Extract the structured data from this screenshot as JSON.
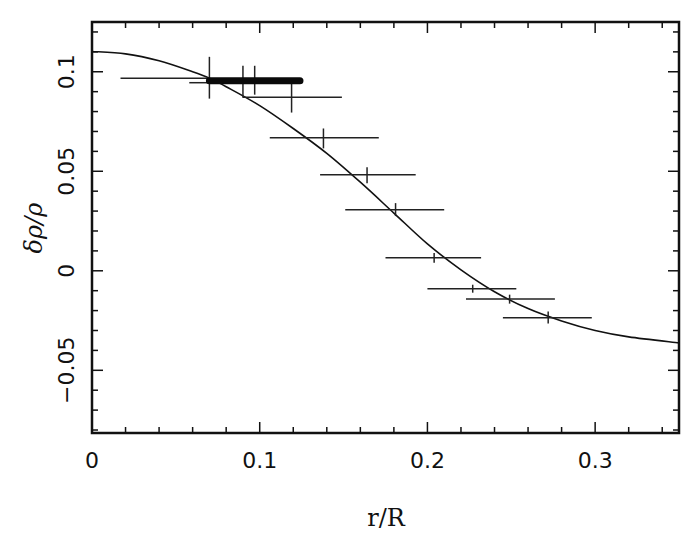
{
  "chart_data": {
    "type": "scatter",
    "title": "",
    "xlabel": "r/R",
    "ylabel": "δρ/ρ",
    "xlim": [
      0,
      0.35
    ],
    "ylim": [
      -0.0815,
      0.125
    ],
    "grid": false,
    "legend": null,
    "x_ticks": [
      {
        "value": 0,
        "label": "0"
      },
      {
        "value": 0.1,
        "label": "0.1"
      },
      {
        "value": 0.2,
        "label": "0.2"
      },
      {
        "value": 0.3,
        "label": "0.3"
      }
    ],
    "x_minor_step": 0.02,
    "y_ticks": [
      {
        "value": -0.05,
        "label": "−0.05"
      },
      {
        "value": 0,
        "label": "0"
      },
      {
        "value": 0.05,
        "label": "0.05"
      },
      {
        "value": 0.1,
        "label": "0.1"
      }
    ],
    "y_minor_step": 0.01,
    "series": [
      {
        "name": "measurements",
        "kind": "errorbar",
        "points": [
          {
            "x": 0.07,
            "y": 0.0968,
            "xmin": 0.017,
            "xmax": 0.07,
            "ymin": 0.0865,
            "ymax": 0.1075
          },
          {
            "x": 0.07,
            "y": 0.0945,
            "xmin": 0.058,
            "xmax": 0.07,
            "ymin": 0.0945,
            "ymax": 0.0945
          },
          {
            "x": 0.09,
            "y": 0.0955,
            "xmin": 0.09,
            "xmax": 0.09,
            "ymin": 0.087,
            "ymax": 0.103
          },
          {
            "x": 0.097,
            "y": 0.0955,
            "xmin": 0.097,
            "xmax": 0.097,
            "ymin": 0.0885,
            "ymax": 0.103
          },
          {
            "x": 0.119,
            "y": 0.0872,
            "xmin": 0.09,
            "xmax": 0.149,
            "ymin": 0.0795,
            "ymax": 0.0945
          },
          {
            "x": 0.138,
            "y": 0.0668,
            "xmin": 0.106,
            "xmax": 0.171,
            "ymin": 0.0615,
            "ymax": 0.0715
          },
          {
            "x": 0.164,
            "y": 0.0482,
            "xmin": 0.136,
            "xmax": 0.193,
            "ymin": 0.044,
            "ymax": 0.052
          },
          {
            "x": 0.181,
            "y": 0.0307,
            "xmin": 0.151,
            "xmax": 0.21,
            "ymin": 0.0275,
            "ymax": 0.034
          },
          {
            "x": 0.204,
            "y": 0.0065,
            "xmin": 0.175,
            "xmax": 0.232,
            "ymin": 0.004,
            "ymax": 0.009
          },
          {
            "x": 0.227,
            "y": -0.009,
            "xmin": 0.2,
            "xmax": 0.253,
            "ymin": -0.011,
            "ymax": -0.007
          },
          {
            "x": 0.249,
            "y": -0.0142,
            "xmin": 0.223,
            "xmax": 0.276,
            "ymin": -0.0165,
            "ymax": -0.012
          },
          {
            "x": 0.272,
            "y": -0.0236,
            "xmin": 0.245,
            "xmax": 0.298,
            "ymin": -0.0265,
            "ymax": -0.0205
          }
        ]
      },
      {
        "name": "thick-band",
        "kind": "bar-segment",
        "x_start": 0.07,
        "x_end": 0.124,
        "y": 0.0955
      },
      {
        "name": "model-curve",
        "kind": "line",
        "x": [
          0,
          0.02,
          0.04,
          0.06,
          0.07,
          0.08,
          0.1,
          0.12,
          0.14,
          0.16,
          0.18,
          0.2,
          0.22,
          0.24,
          0.26,
          0.28,
          0.3,
          0.32,
          0.35
        ],
        "y": [
          0.1102,
          0.109,
          0.1055,
          0.1,
          0.0968,
          0.0925,
          0.083,
          0.0715,
          0.059,
          0.0445,
          0.029,
          0.0135,
          0.0005,
          -0.0105,
          -0.019,
          -0.0252,
          -0.03,
          -0.0332,
          -0.0362
        ]
      }
    ]
  },
  "axes": {
    "x_title": "r/R",
    "y_title": "δρ/ρ"
  }
}
